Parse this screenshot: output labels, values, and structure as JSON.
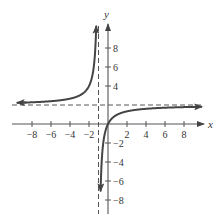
{
  "chart_data": {
    "type": "line",
    "title": "",
    "xlabel": "x",
    "ylabel": "y",
    "function": "y = 2x/(x+1)",
    "xlim": [
      -10,
      10
    ],
    "ylim": [
      -10,
      10
    ],
    "grid": false,
    "x_ticks": [
      -8,
      -6,
      -4,
      -2,
      2,
      4,
      6,
      8
    ],
    "y_ticks": [
      8,
      6,
      4,
      -2,
      -4,
      -6,
      -8
    ],
    "x_tick_labels": [
      "−8",
      "−6",
      "−4",
      "−2",
      "2",
      "4",
      "6",
      "8"
    ],
    "y_tick_labels": [
      "8",
      "6",
      "4",
      "−2",
      "−4",
      "−6",
      "−8"
    ],
    "asymptotes": {
      "vertical": {
        "x": -1,
        "style": "dashed"
      },
      "horizontal": {
        "y": 2,
        "style": "dashed"
      }
    },
    "series": [
      {
        "name": "left branch",
        "x": [
          -9.2,
          -8,
          -6,
          -4,
          -3,
          -2,
          -1.6,
          -1.4,
          -1.3,
          -1.25
        ],
        "y": [
          2.24,
          2.29,
          2.4,
          2.67,
          3.0,
          4.0,
          5.33,
          7.0,
          8.67,
          10.0
        ]
      },
      {
        "name": "right branch",
        "x": [
          -0.8,
          -0.7,
          -0.5,
          0,
          1,
          2,
          4,
          6,
          8,
          9.5
        ],
        "y": [
          -8.0,
          -4.67,
          -2.0,
          0,
          1.0,
          1.33,
          1.6,
          1.71,
          1.78,
          1.81
        ]
      }
    ],
    "colors": {
      "curve": "#444444",
      "axes": "#555555",
      "asymptote": "#555555"
    }
  }
}
